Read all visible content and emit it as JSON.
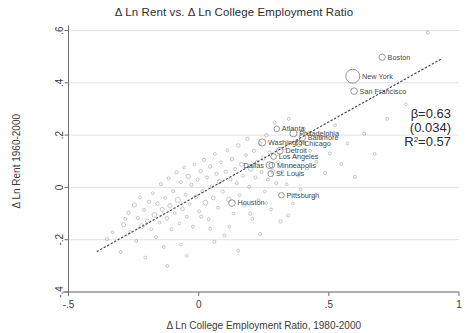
{
  "chart_data": {
    "type": "scatter",
    "title": "Δ Ln Rent vs. Δ Ln College Employment Ratio",
    "xlabel": "Δ Ln College Employment Ratio, 1980-2000",
    "ylabel": "Δ Ln Rent 1960-2000",
    "xlim": [
      -0.5,
      1.0
    ],
    "ylim": [
      -0.4,
      0.6
    ],
    "xticks": [
      "-.5",
      "0",
      ".5",
      "1"
    ],
    "xtick_values": [
      -0.5,
      0,
      0.5,
      1
    ],
    "yticks": [
      "-.4",
      "-.2",
      "0",
      ".2",
      ".4",
      ".6"
    ],
    "ytick_values": [
      -0.4,
      -0.2,
      0,
      0.2,
      0.4,
      0.6
    ],
    "grid": true,
    "legend": "none",
    "marker_style": "hollow-circle",
    "marker_color": "#8a8a8a",
    "fit_line": {
      "style": "dotted",
      "color": "#4a4a4a",
      "x_start": -0.39,
      "y_start": -0.245,
      "x_end": 0.93,
      "y_end": 0.49
    },
    "annotations": {
      "beta": "β=0.63",
      "se": "(0.034)",
      "r2_prefix": "R",
      "r2_sup": "2",
      "r2_value": "=0.57"
    },
    "labeled_cities": [
      {
        "name": "Boston",
        "x": 0.705,
        "y": 0.498,
        "r": 3.2,
        "label_side": "right"
      },
      {
        "name": "New York",
        "x": 0.592,
        "y": 0.425,
        "r": 7.0,
        "label_side": "right"
      },
      {
        "name": "San Francisco",
        "x": 0.597,
        "y": 0.368,
        "r": 3.3,
        "label_side": "right"
      },
      {
        "name": "Atlanta",
        "x": 0.3,
        "y": 0.224,
        "r": 2.8,
        "label_side": "right"
      },
      {
        "name": "Philadelphia",
        "x": 0.364,
        "y": 0.207,
        "r": 3.6,
        "label_side": "right"
      },
      {
        "name": "Baltimore",
        "x": 0.398,
        "y": 0.19,
        "r": 3.2,
        "label_side": "right"
      },
      {
        "name": "Chicago",
        "x": 0.385,
        "y": 0.168,
        "r": 3.0,
        "label_side": "right"
      },
      {
        "name": "Washington",
        "x": 0.244,
        "y": 0.172,
        "r": 3.6,
        "label_side": "right"
      },
      {
        "name": "Detroit",
        "x": 0.312,
        "y": 0.14,
        "r": 3.3,
        "label_side": "right"
      },
      {
        "name": "Los Angeles",
        "x": 0.288,
        "y": 0.118,
        "r": 2.8,
        "label_side": "right"
      },
      {
        "name": "Dallas",
        "x": 0.272,
        "y": 0.085,
        "r": 3.4,
        "label_side": "left"
      },
      {
        "name": "Minneapolis",
        "x": 0.281,
        "y": 0.085,
        "r": 2.9,
        "label_side": "right"
      },
      {
        "name": "St. Louis",
        "x": 0.277,
        "y": 0.052,
        "r": 2.9,
        "label_side": "right"
      },
      {
        "name": "Pittsburgh",
        "x": 0.318,
        "y": -0.03,
        "r": 2.8,
        "label_side": "right"
      },
      {
        "name": "Houston",
        "x": 0.128,
        "y": -0.06,
        "r": 3.3,
        "label_side": "right"
      }
    ],
    "points": [
      {
        "x": -0.352,
        "y": -0.198,
        "r": 1.6
      },
      {
        "x": -0.33,
        "y": -0.172,
        "r": 1.4
      },
      {
        "x": -0.3,
        "y": -0.247,
        "r": 1.5
      },
      {
        "x": -0.288,
        "y": -0.143,
        "r": 2.0
      },
      {
        "x": -0.282,
        "y": -0.12,
        "r": 1.5
      },
      {
        "x": -0.27,
        "y": -0.097,
        "r": 1.7
      },
      {
        "x": -0.263,
        "y": -0.17,
        "r": 1.4
      },
      {
        "x": -0.247,
        "y": -0.067,
        "r": 2.1
      },
      {
        "x": -0.24,
        "y": -0.205,
        "r": 1.5
      },
      {
        "x": -0.234,
        "y": -0.117,
        "r": 1.6
      },
      {
        "x": -0.225,
        "y": -0.038,
        "r": 1.4
      },
      {
        "x": -0.218,
        "y": -0.148,
        "r": 2.3
      },
      {
        "x": -0.21,
        "y": -0.086,
        "r": 1.5
      },
      {
        "x": -0.205,
        "y": -0.268,
        "r": 1.4
      },
      {
        "x": -0.198,
        "y": -0.128,
        "r": 1.8
      },
      {
        "x": -0.19,
        "y": -0.055,
        "r": 1.6
      },
      {
        "x": -0.182,
        "y": -0.16,
        "r": 1.5
      },
      {
        "x": -0.176,
        "y": -0.022,
        "r": 1.4
      },
      {
        "x": -0.17,
        "y": -0.105,
        "r": 2.4
      },
      {
        "x": -0.164,
        "y": -0.19,
        "r": 1.5
      },
      {
        "x": -0.158,
        "y": -0.062,
        "r": 1.7
      },
      {
        "x": -0.15,
        "y": -0.135,
        "r": 1.4
      },
      {
        "x": -0.145,
        "y": 0.012,
        "r": 1.6
      },
      {
        "x": -0.14,
        "y": -0.084,
        "r": 2.0
      },
      {
        "x": -0.134,
        "y": -0.228,
        "r": 1.4
      },
      {
        "x": -0.128,
        "y": -0.04,
        "r": 1.5
      },
      {
        "x": -0.122,
        "y": -0.118,
        "r": 1.8
      },
      {
        "x": -0.116,
        "y": 0.035,
        "r": 1.4
      },
      {
        "x": -0.11,
        "y": -0.07,
        "r": 2.2
      },
      {
        "x": -0.104,
        "y": -0.16,
        "r": 1.5
      },
      {
        "x": -0.098,
        "y": -0.015,
        "r": 1.6
      },
      {
        "x": -0.092,
        "y": -0.098,
        "r": 1.4
      },
      {
        "x": -0.086,
        "y": 0.058,
        "r": 1.7
      },
      {
        "x": -0.08,
        "y": -0.048,
        "r": 2.6
      },
      {
        "x": -0.074,
        "y": -0.138,
        "r": 1.4
      },
      {
        "x": -0.068,
        "y": 0.02,
        "r": 1.5
      },
      {
        "x": -0.062,
        "y": -0.082,
        "r": 1.9
      },
      {
        "x": -0.056,
        "y": 0.076,
        "r": 1.4
      },
      {
        "x": -0.05,
        "y": -0.028,
        "r": 1.6
      },
      {
        "x": -0.046,
        "y": -0.112,
        "r": 1.5
      },
      {
        "x": -0.04,
        "y": 0.042,
        "r": 2.2
      },
      {
        "x": -0.034,
        "y": -0.064,
        "r": 1.4
      },
      {
        "x": -0.028,
        "y": 0.01,
        "r": 1.7
      },
      {
        "x": -0.022,
        "y": -0.15,
        "r": 1.5
      },
      {
        "x": -0.016,
        "y": 0.088,
        "r": 1.4
      },
      {
        "x": -0.01,
        "y": -0.036,
        "r": 2.0
      },
      {
        "x": -0.004,
        "y": 0.03,
        "r": 1.6
      },
      {
        "x": 0.002,
        "y": -0.092,
        "r": 1.5
      },
      {
        "x": 0.008,
        "y": 0.062,
        "r": 1.8
      },
      {
        "x": 0.014,
        "y": -0.014,
        "r": 1.4
      },
      {
        "x": 0.02,
        "y": 0.105,
        "r": 1.6
      },
      {
        "x": 0.026,
        "y": -0.058,
        "r": 2.4
      },
      {
        "x": 0.032,
        "y": 0.038,
        "r": 1.5
      },
      {
        "x": 0.038,
        "y": -0.122,
        "r": 1.4
      },
      {
        "x": 0.044,
        "y": 0.08,
        "r": 1.7
      },
      {
        "x": 0.05,
        "y": 0.004,
        "r": 1.5
      },
      {
        "x": 0.056,
        "y": -0.04,
        "r": 1.9
      },
      {
        "x": 0.062,
        "y": 0.128,
        "r": 1.4
      },
      {
        "x": 0.068,
        "y": 0.052,
        "r": 1.6
      },
      {
        "x": 0.074,
        "y": -0.078,
        "r": 1.5
      },
      {
        "x": 0.08,
        "y": 0.022,
        "r": 2.1
      },
      {
        "x": 0.086,
        "y": 0.096,
        "r": 1.4
      },
      {
        "x": 0.092,
        "y": -0.016,
        "r": 1.7
      },
      {
        "x": 0.098,
        "y": -0.184,
        "r": 1.5
      },
      {
        "x": 0.104,
        "y": 0.06,
        "r": 1.6
      },
      {
        "x": 0.11,
        "y": 0.142,
        "r": 1.4
      },
      {
        "x": 0.116,
        "y": -0.046,
        "r": 2.3
      },
      {
        "x": 0.122,
        "y": 0.03,
        "r": 1.5
      },
      {
        "x": 0.128,
        "y": 0.108,
        "r": 1.7
      },
      {
        "x": 0.134,
        "y": -0.1,
        "r": 1.4
      },
      {
        "x": 0.14,
        "y": 0.07,
        "r": 1.6
      },
      {
        "x": 0.146,
        "y": 0.016,
        "r": 1.5
      },
      {
        "x": 0.152,
        "y": 0.16,
        "r": 1.8
      },
      {
        "x": 0.158,
        "y": -0.03,
        "r": 1.4
      },
      {
        "x": 0.164,
        "y": 0.088,
        "r": 2.0
      },
      {
        "x": 0.17,
        "y": 0.044,
        "r": 1.5
      },
      {
        "x": 0.176,
        "y": -0.068,
        "r": 1.6
      },
      {
        "x": 0.182,
        "y": 0.124,
        "r": 1.4
      },
      {
        "x": 0.188,
        "y": 0.186,
        "r": 1.7
      },
      {
        "x": 0.194,
        "y": 0.002,
        "r": 1.5
      },
      {
        "x": 0.2,
        "y": 0.072,
        "r": 2.5
      },
      {
        "x": 0.206,
        "y": -0.12,
        "r": 1.4
      },
      {
        "x": 0.212,
        "y": 0.14,
        "r": 1.6
      },
      {
        "x": 0.218,
        "y": 0.038,
        "r": 1.5
      },
      {
        "x": 0.224,
        "y": 0.096,
        "r": 1.8
      },
      {
        "x": 0.23,
        "y": -0.048,
        "r": 1.4
      },
      {
        "x": 0.236,
        "y": 0.168,
        "r": 1.6
      },
      {
        "x": 0.242,
        "y": 0.058,
        "r": 1.5
      },
      {
        "x": 0.248,
        "y": 0.112,
        "r": 2.1
      },
      {
        "x": 0.254,
        "y": -0.016,
        "r": 1.4
      },
      {
        "x": 0.26,
        "y": 0.2,
        "r": 1.7
      },
      {
        "x": 0.266,
        "y": 0.03,
        "r": 1.5
      },
      {
        "x": 0.272,
        "y": 0.134,
        "r": 1.6
      },
      {
        "x": 0.278,
        "y": -0.084,
        "r": 1.4
      },
      {
        "x": 0.284,
        "y": 0.062,
        "r": 1.9
      },
      {
        "x": 0.292,
        "y": 0.248,
        "r": 1.5
      },
      {
        "x": 0.298,
        "y": 0.016,
        "r": 1.6
      },
      {
        "x": 0.306,
        "y": 0.096,
        "r": 1.4
      },
      {
        "x": 0.314,
        "y": -0.13,
        "r": 1.7
      },
      {
        "x": 0.322,
        "y": 0.06,
        "r": 1.5
      },
      {
        "x": 0.33,
        "y": 0.15,
        "r": 1.6
      },
      {
        "x": 0.338,
        "y": 0.012,
        "r": 1.4
      },
      {
        "x": 0.346,
        "y": 0.262,
        "r": 1.5
      },
      {
        "x": 0.354,
        "y": 0.082,
        "r": 1.8
      },
      {
        "x": 0.362,
        "y": -0.062,
        "r": 1.4
      },
      {
        "x": 0.372,
        "y": 0.118,
        "r": 1.6
      },
      {
        "x": 0.382,
        "y": 0.044,
        "r": 1.5
      },
      {
        "x": 0.392,
        "y": -0.008,
        "r": 1.4
      },
      {
        "x": 0.404,
        "y": 0.225,
        "r": 1.6
      },
      {
        "x": 0.416,
        "y": 0.072,
        "r": 1.5
      },
      {
        "x": 0.428,
        "y": 0.14,
        "r": 1.4
      },
      {
        "x": 0.44,
        "y": -0.04,
        "r": 1.6
      },
      {
        "x": 0.452,
        "y": 0.098,
        "r": 1.5
      },
      {
        "x": 0.468,
        "y": 0.188,
        "r": 1.4
      },
      {
        "x": 0.486,
        "y": 0.055,
        "r": 1.6
      },
      {
        "x": 0.504,
        "y": 0.13,
        "r": 1.5
      },
      {
        "x": 0.524,
        "y": 0.238,
        "r": 1.4
      },
      {
        "x": 0.548,
        "y": 0.09,
        "r": 1.5
      },
      {
        "x": 0.572,
        "y": 0.168,
        "r": 1.4
      },
      {
        "x": 0.6,
        "y": 0.04,
        "r": 1.6
      },
      {
        "x": 0.636,
        "y": 0.205,
        "r": 1.5
      },
      {
        "x": 0.676,
        "y": 0.128,
        "r": 1.4
      },
      {
        "x": 0.724,
        "y": 0.262,
        "r": 1.5
      },
      {
        "x": 0.796,
        "y": 0.318,
        "r": 1.4
      },
      {
        "x": 0.88,
        "y": 0.592,
        "r": 1.5
      },
      {
        "x": -0.12,
        "y": -0.3,
        "r": 1.5
      },
      {
        "x": -0.046,
        "y": -0.262,
        "r": 1.4
      },
      {
        "x": 0.06,
        "y": -0.208,
        "r": 1.6
      },
      {
        "x": 0.152,
        "y": -0.242,
        "r": 1.4
      },
      {
        "x": 0.236,
        "y": -0.178,
        "r": 1.5
      },
      {
        "x": 0.198,
        "y": -0.1,
        "r": 1.6
      },
      {
        "x": 0.26,
        "y": -0.06,
        "r": 1.4
      },
      {
        "x": 0.344,
        "y": -0.108,
        "r": 1.5
      },
      {
        "x": 0.118,
        "y": -0.15,
        "r": 1.4
      },
      {
        "x": 0.044,
        "y": -0.158,
        "r": 1.5
      },
      {
        "x": -0.068,
        "y": -0.218,
        "r": 1.4
      },
      {
        "x": 0.01,
        "y": -0.112,
        "r": 1.6
      }
    ]
  }
}
